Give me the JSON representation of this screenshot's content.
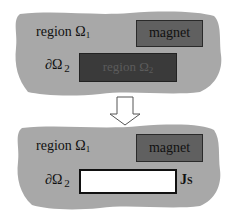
{
  "colors": {
    "blob_fill": "#a8a8a8",
    "magnet_fill": "#606060",
    "region2_fill": "#3a3a3a",
    "hole_fill": "#ffffff"
  },
  "top_panel": {
    "region1_label": "region Ω",
    "region1_sub": "1",
    "magnet_label": "magnet",
    "boundary_label": "∂Ω",
    "boundary_sub": "2",
    "region2_label": "region Ω",
    "region2_sub": "2"
  },
  "arrow": {
    "direction": "down",
    "icon": "hollow-down-arrow-icon"
  },
  "bottom_panel": {
    "region1_label": "region Ω",
    "region1_sub": "1",
    "magnet_label": "magnet",
    "boundary_label": "∂Ω",
    "boundary_sub": "2",
    "current_label": "J",
    "current_sub": "S"
  }
}
